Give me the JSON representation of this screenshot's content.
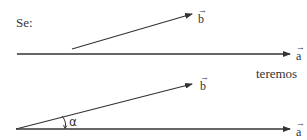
{
  "intro_label": "Se:",
  "result_label": "teremos",
  "colors": {
    "line": "#333333",
    "text": "#333333",
    "background": "#ffffff"
  },
  "diagram_top": {
    "vector_a": {
      "label": "a",
      "arrow": "→"
    },
    "vector_b": {
      "label": "b",
      "arrow": "→"
    }
  },
  "diagram_bottom": {
    "vector_a": {
      "label": "a",
      "arrow": "→"
    },
    "vector_b": {
      "label": "b",
      "arrow": "→"
    },
    "angle": {
      "label": "α"
    }
  }
}
